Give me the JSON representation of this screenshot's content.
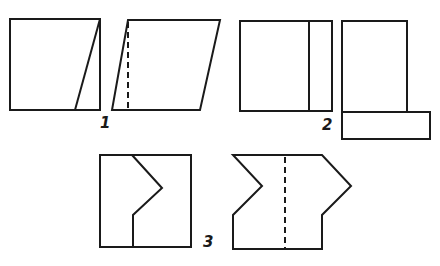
{
  "header": {
    "text": ""
  },
  "figures": [
    {
      "id": "1",
      "label": "1",
      "description": "Square cut along slanted line, piece moved to form parallelogram"
    },
    {
      "id": "2",
      "label": "2",
      "description": "Square cut along vertical strip, strip moved to bottom forming L-shape"
    },
    {
      "id": "3",
      "label": "3",
      "description": "Square cut along zig-zag line, piece moved to form notched shape"
    }
  ],
  "colors": {
    "stroke": "#1a1a1a",
    "background": "#ffffff"
  }
}
